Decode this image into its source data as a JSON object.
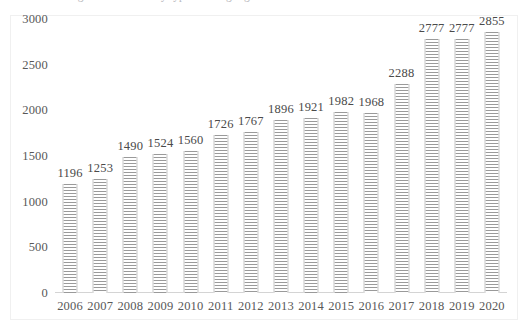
{
  "caption": {
    "text": "Number of registered vessels by type and flag registration documents"
  },
  "chart_data": {
    "type": "bar",
    "title": "",
    "subtitle": "",
    "xlabel": "",
    "ylabel": "",
    "categories": [
      "2006",
      "2007",
      "2008",
      "2009",
      "2010",
      "2011",
      "2012",
      "2013",
      "2014",
      "2015",
      "2016",
      "2017",
      "2018",
      "2019",
      "2020"
    ],
    "values": [
      1196,
      1253,
      1490,
      1524,
      1560,
      1726,
      1767,
      1896,
      1921,
      1982,
      1968,
      2288,
      2777,
      2777,
      2855
    ],
    "series": [
      {
        "name": "",
        "values": [
          1196,
          1253,
          1490,
          1524,
          1560,
          1726,
          1767,
          1896,
          1921,
          1982,
          1968,
          2288,
          2777,
          2777,
          2855
        ]
      }
    ],
    "data_labels": [
      "1196",
      "1253",
      "1490",
      "1524",
      "1560",
      "1726",
      "1767",
      "1896",
      "1921",
      "1982",
      "1968",
      "2288",
      "2777",
      "2777",
      "2855"
    ],
    "ylim": [
      0,
      3000
    ],
    "yticks": [
      0,
      500,
      1000,
      1500,
      2000,
      2500,
      3000
    ],
    "ytick_labels": [
      "0",
      "500",
      "1000",
      "1500",
      "2000",
      "2500",
      "3000"
    ],
    "grid": false,
    "legend": null,
    "legend_position": "none",
    "bar_fill": "#9a9a9a",
    "bar_pattern": "horizontal-stripes",
    "text_color": "#585858"
  }
}
